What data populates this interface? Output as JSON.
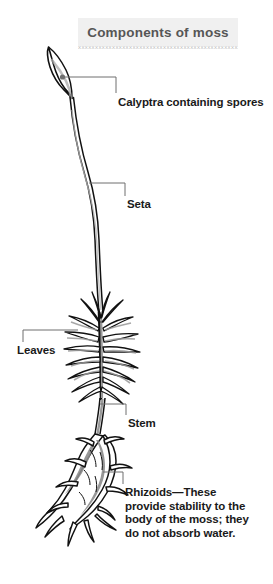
{
  "figure": {
    "title": "Components of moss",
    "background_color": "#ffffff",
    "title_band_color": "#f0f0f0",
    "title_text_color": "#565656",
    "leader_line_color": "#6e6e6e",
    "label_text_color": "#1a1a1a",
    "plant_outline_color": "#111111",
    "plant_shading_color": "#8a8a8a",
    "decorative_rule_glyphs": "xxxxxxxxxxxxxxxxxxxxxxxxxxxxxxxxxxxxxxxxxxxxxxxxxxxxxx"
  },
  "labels": {
    "calyptra": "Calyptra containing spores",
    "seta": "Seta",
    "leaves": "Leaves",
    "stem": "Stem",
    "rhizoids": "Rhizoids—These provide stability to the body of the moss; they do not absorb water."
  }
}
